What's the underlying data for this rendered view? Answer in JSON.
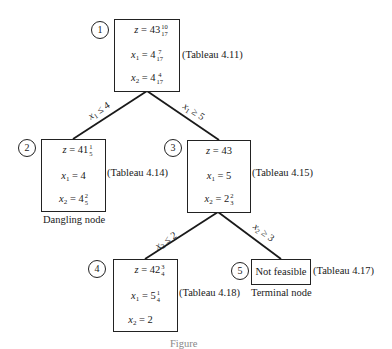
{
  "diagram": {
    "type": "branch-and-bound tree",
    "nodes": [
      {
        "id": "1",
        "label": "1",
        "z": {
          "whole": "43",
          "num": "10",
          "den": "17"
        },
        "x1": {
          "whole": "4",
          "num": "7",
          "den": "17"
        },
        "x2": {
          "whole": "4",
          "num": "4",
          "den": "17"
        },
        "tableau": "(Tableau 4.11)"
      },
      {
        "id": "2",
        "label": "2",
        "z": {
          "whole": "41",
          "num": "1",
          "den": "5"
        },
        "x1": {
          "whole": "4",
          "num": "",
          "den": ""
        },
        "x2": {
          "whole": "4",
          "num": "2",
          "den": "5"
        },
        "tableau": "(Tableau 4.14)",
        "note": "Dangling node"
      },
      {
        "id": "3",
        "label": "3",
        "z": {
          "whole": "43",
          "num": "",
          "den": ""
        },
        "x1": {
          "whole": "5",
          "num": "",
          "den": ""
        },
        "x2": {
          "whole": "2",
          "num": "2",
          "den": "3"
        },
        "tableau": "(Tableau 4.15)"
      },
      {
        "id": "4",
        "label": "4",
        "z": {
          "whole": "42",
          "num": "3",
          "den": "4"
        },
        "x1": {
          "whole": "5",
          "num": "1",
          "den": "4"
        },
        "x2": {
          "whole": "2",
          "num": "",
          "den": ""
        },
        "tableau": "(Tableau 4.18)"
      },
      {
        "id": "5",
        "label": "5",
        "text": "Not feasible",
        "tableau": "(Tableau 4.17)",
        "note": "Terminal node"
      }
    ],
    "edges": [
      {
        "from": "1",
        "to": "2",
        "var": "x",
        "sub": "1",
        "op": "≤",
        "value": "4"
      },
      {
        "from": "1",
        "to": "3",
        "var": "x",
        "sub": "1",
        "op": "≥",
        "value": "5"
      },
      {
        "from": "3",
        "to": "4",
        "var": "x",
        "sub": "2",
        "op": "≤",
        "value": "2"
      },
      {
        "from": "3",
        "to": "5",
        "var": "x",
        "sub": "2",
        "op": "≥",
        "value": "3"
      }
    ],
    "symbols": {
      "z": "z",
      "x": "x",
      "eq": " = ",
      "sub1": "1",
      "sub2": "2"
    },
    "caption": "Figure"
  }
}
